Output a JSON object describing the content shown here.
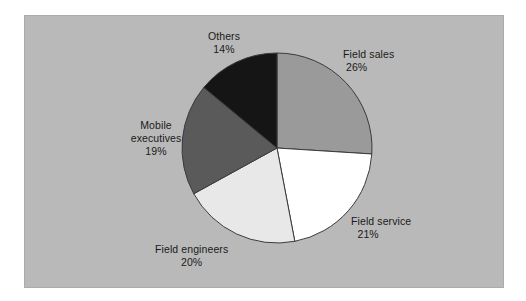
{
  "figure": {
    "background_color": "#ffffff",
    "panel_color": "#b9b9b9",
    "panel_border_color": "#ababab",
    "text_color": "#1a1a1a",
    "slice_border_color": "#3a3a3a"
  },
  "chart_data": {
    "type": "pie",
    "title": "",
    "subtitle": "",
    "xlabel": "",
    "ylabel": "",
    "legend_position": "none",
    "grid": false,
    "start_angle_deg": 0,
    "direction": "clockwise",
    "labels_outside": true,
    "categories": [
      "Field sales",
      "Field service",
      "Field engineers",
      "Mobile executives",
      "Others"
    ],
    "values": [
      26,
      21,
      20,
      19,
      14
    ],
    "value_unit": "%",
    "colors": [
      "#9a9a9a",
      "#ffffff",
      "#e8e8e8",
      "#5a5a5a",
      "#151515"
    ],
    "slices": [
      {
        "label": "Field sales",
        "value": 26,
        "percent_text": "26%",
        "color": "#9a9a9a"
      },
      {
        "label": "Field service",
        "value": 21,
        "percent_text": "21%",
        "color": "#ffffff"
      },
      {
        "label": "Field engineers",
        "value": 20,
        "percent_text": "20%",
        "color": "#e8e8e8"
      },
      {
        "label": "Mobile executives",
        "value": 19,
        "percent_text": "19%",
        "color": "#5a5a5a"
      },
      {
        "label": "Others",
        "value": 14,
        "percent_text": "14%",
        "color": "#151515"
      }
    ]
  },
  "labels": {
    "field_sales": {
      "name": "Field sales",
      "percent": "26%"
    },
    "field_service": {
      "name": "Field service",
      "percent": "21%"
    },
    "field_engineers": {
      "name": "Field engineers",
      "percent": "20%"
    },
    "mobile_executives": {
      "name_line1": "Mobile",
      "name_line2": "executives",
      "percent": "19%"
    },
    "others": {
      "name": "Others",
      "percent": "14%"
    }
  }
}
